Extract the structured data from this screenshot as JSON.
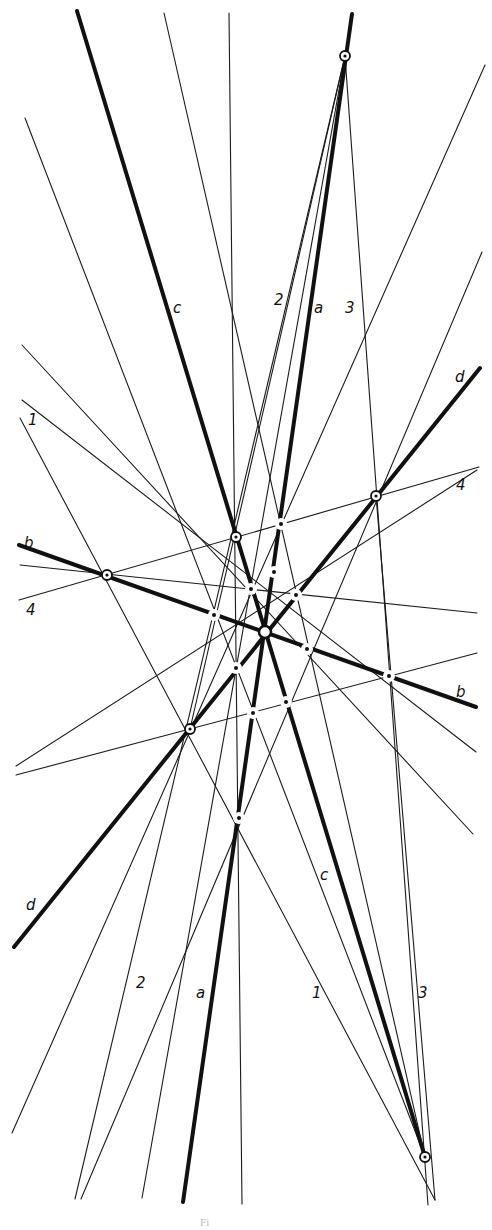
{
  "figure": {
    "caption_fragment": "Fi",
    "background": "#ffffff",
    "ink": "#111111"
  },
  "vertices": {
    "T": {
      "x": 345,
      "y": 56,
      "style": "circled"
    },
    "B": {
      "x": 425,
      "y": 1157,
      "style": "circled"
    },
    "L": {
      "x": 107,
      "y": 575,
      "style": "circled"
    },
    "R": {
      "x": 376,
      "y": 496,
      "style": "circled"
    },
    "U": {
      "x": 236,
      "y": 537,
      "style": "circled"
    },
    "D": {
      "x": 190,
      "y": 729,
      "style": "circled"
    },
    "O": {
      "x": 265,
      "y": 632,
      "style": "center-ring"
    }
  },
  "points": [
    {
      "x": 281,
      "y": 524
    },
    {
      "x": 274,
      "y": 572
    },
    {
      "x": 251,
      "y": 589
    },
    {
      "x": 296,
      "y": 595
    },
    {
      "x": 214,
      "y": 615
    },
    {
      "x": 307,
      "y": 649
    },
    {
      "x": 389,
      "y": 676
    },
    {
      "x": 236,
      "y": 668
    },
    {
      "x": 286,
      "y": 702
    },
    {
      "x": 253,
      "y": 713
    },
    {
      "x": 239,
      "y": 818
    }
  ],
  "thick_lines": [
    {
      "name": "c",
      "x1": 77,
      "y1": 11,
      "x2": 425,
      "y2": 1157
    },
    {
      "name": "a",
      "x1": 352,
      "y1": 14,
      "x2": 183,
      "y2": 1202
    },
    {
      "name": "b",
      "x1": 19,
      "y1": 545,
      "x2": 476,
      "y2": 707
    },
    {
      "name": "d",
      "x1": 480,
      "y1": 368,
      "x2": 14,
      "y2": 947
    }
  ],
  "thin_lines": [
    {
      "name": "1",
      "x1": 20,
      "y1": 418,
      "x2": 435,
      "y2": 1200
    },
    {
      "name": "2",
      "x1": 345,
      "y1": 56,
      "x2": 75,
      "y2": 1199
    },
    {
      "name": "3",
      "x1": 345,
      "y1": 56,
      "x2": 428,
      "y2": 1205
    },
    {
      "name": "4",
      "x1": 19,
      "y1": 600,
      "x2": 479,
      "y2": 467
    },
    {
      "name": "",
      "x1": 164,
      "y1": 13,
      "x2": 425,
      "y2": 1157
    },
    {
      "name": "",
      "x1": 229,
      "y1": 13,
      "x2": 242,
      "y2": 1204
    },
    {
      "name": "",
      "x1": 25,
      "y1": 118,
      "x2": 425,
      "y2": 1157
    },
    {
      "name": "",
      "x1": 22,
      "y1": 345,
      "x2": 473,
      "y2": 834
    },
    {
      "name": "",
      "x1": 485,
      "y1": 65,
      "x2": 12,
      "y2": 1133
    },
    {
      "name": "",
      "x1": 482,
      "y1": 252,
      "x2": 81,
      "y2": 1199
    },
    {
      "name": "",
      "x1": 20,
      "y1": 565,
      "x2": 477,
      "y2": 613
    },
    {
      "name": "",
      "x1": 16,
      "y1": 775,
      "x2": 477,
      "y2": 653
    },
    {
      "name": "",
      "x1": 16,
      "y1": 766,
      "x2": 477,
      "y2": 470
    },
    {
      "name": "",
      "x1": 22,
      "y1": 400,
      "x2": 476,
      "y2": 752
    },
    {
      "name": "",
      "x1": 345,
      "y1": 56,
      "x2": 142,
      "y2": 1198
    },
    {
      "name": "",
      "x1": 345,
      "y1": 56,
      "x2": 190,
      "y2": 729
    },
    {
      "name": "",
      "x1": 376,
      "y1": 496,
      "x2": 435,
      "y2": 1200
    }
  ],
  "labels": [
    {
      "text": "c",
      "x": 173,
      "y": 313
    },
    {
      "text": "2",
      "x": 274,
      "y": 305
    },
    {
      "text": "a",
      "x": 314,
      "y": 313
    },
    {
      "text": "3",
      "x": 345,
      "y": 313
    },
    {
      "text": "d",
      "x": 455,
      "y": 382
    },
    {
      "text": "1",
      "x": 28,
      "y": 425
    },
    {
      "text": "4",
      "x": 456,
      "y": 490
    },
    {
      "text": "b",
      "x": 24,
      "y": 548
    },
    {
      "text": "4",
      "x": 26,
      "y": 615
    },
    {
      "text": "b",
      "x": 456,
      "y": 697
    },
    {
      "text": "c",
      "x": 320,
      "y": 880
    },
    {
      "text": "d",
      "x": 26,
      "y": 910
    },
    {
      "text": "2",
      "x": 136,
      "y": 988
    },
    {
      "text": "a",
      "x": 196,
      "y": 998
    },
    {
      "text": "1",
      "x": 312,
      "y": 998
    },
    {
      "text": "3",
      "x": 418,
      "y": 998
    }
  ]
}
